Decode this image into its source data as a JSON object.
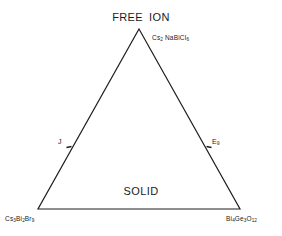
{
  "figure": {
    "type": "ternary-triangle-diagram",
    "background_color": "#ffffff",
    "line_color": "#1f1f1f"
  },
  "apex": {
    "label_part1": "FREE",
    "label_part2": "ION"
  },
  "base": {
    "label": "SOLID"
  },
  "compounds": {
    "apex_right": {
      "prefix": "Cs",
      "sub1": "2",
      "mid": "NaBiCl",
      "sub2": "6"
    },
    "bottom_left": {
      "a": "Cs",
      "a_sub": "3",
      "b": "Bi",
      "b_sub": "2",
      "c": "Br",
      "c_sub": "9"
    },
    "bottom_right": {
      "a": "Bi",
      "a_sub": "4",
      "b": "Ge",
      "b_sub": "3",
      "c": "O",
      "c_sub": "12"
    }
  },
  "markers": {
    "left_edge": {
      "label": "J"
    },
    "right_edge": {
      "symbol": "E",
      "subscript": "9"
    }
  },
  "geometry": {
    "apex_x": 139,
    "apex_y": 29,
    "left_x": 38,
    "left_y": 209,
    "right_x": 240,
    "right_y": 209,
    "left_tick_x": 69,
    "left_tick_y": 147,
    "right_tick_x": 209,
    "right_tick_y": 147
  }
}
